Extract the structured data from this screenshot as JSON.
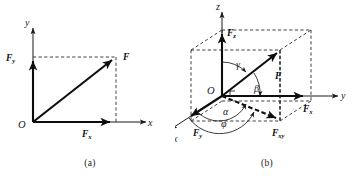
{
  "figure": {
    "background_color": "#ffffff",
    "ink_color": "#1a1a1a",
    "panels": [
      {
        "id": "a",
        "caption": "(a)",
        "description": "Two-dimensional resolution of force F into components Fx and Fy",
        "axes": [
          {
            "name": "x",
            "label": "x",
            "direction": "right"
          },
          {
            "name": "y",
            "label": "y",
            "direction": "up"
          }
        ],
        "origin_label": "O",
        "vectors": [
          {
            "name": "resultant",
            "label": "F",
            "subscript": ""
          },
          {
            "name": "x-component",
            "label": "F",
            "subscript": "x"
          },
          {
            "name": "y-component",
            "label": "F",
            "subscript": "y"
          }
        ]
      },
      {
        "id": "b",
        "caption": "(b)",
        "description": "Three-dimensional resolution of force F into components Fx, Fy, Fz with direction angles",
        "axes": [
          {
            "name": "x",
            "label": "x",
            "direction": "down-left"
          },
          {
            "name": "y",
            "label": "y",
            "direction": "right"
          },
          {
            "name": "z",
            "label": "z",
            "direction": "up"
          }
        ],
        "origin_label": "O",
        "vectors": [
          {
            "name": "resultant",
            "label": "F",
            "subscript": ""
          },
          {
            "name": "x-component",
            "label": "F",
            "subscript": "x"
          },
          {
            "name": "y-component",
            "label": "F",
            "subscript": "y"
          },
          {
            "name": "z-component",
            "label": "F",
            "subscript": "z"
          },
          {
            "name": "xy-projection",
            "label": "F",
            "subscript": "xy"
          }
        ],
        "angles": [
          {
            "name": "alpha",
            "symbol": "α",
            "between": "F and x-axis"
          },
          {
            "name": "beta",
            "symbol": "β",
            "between": "F and y-axis"
          },
          {
            "name": "gamma",
            "symbol": "γ",
            "between": "F and z-axis"
          },
          {
            "name": "phi",
            "symbol": "φ",
            "between": "Fxy and x-axis"
          }
        ]
      }
    ]
  }
}
